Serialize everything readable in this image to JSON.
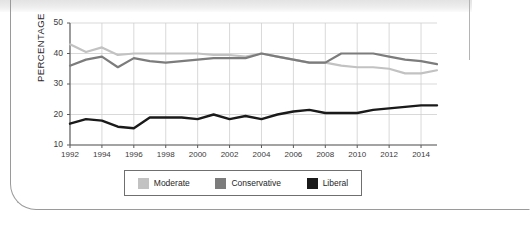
{
  "chart_data": {
    "type": "line",
    "title": "",
    "xlabel": "",
    "ylabel": "PERCENTAGE",
    "xlim": [
      1992,
      2015
    ],
    "ylim": [
      10,
      50
    ],
    "ytick_labels": [
      "50",
      "40",
      "30",
      "20",
      "10"
    ],
    "ytick_values": [
      50,
      40,
      30,
      20,
      10
    ],
    "xtick_labels": [
      "1992",
      "1994",
      "1996",
      "1998",
      "2000",
      "2002",
      "2004",
      "2006",
      "2008",
      "2010",
      "2012",
      "2014"
    ],
    "xtick_values": [
      1992,
      1994,
      1996,
      1998,
      2000,
      2002,
      2004,
      2006,
      2008,
      2010,
      2012,
      2014
    ],
    "grid": true,
    "legend_position": "bottom",
    "x": [
      1992,
      1993,
      1994,
      1995,
      1996,
      1997,
      1998,
      1999,
      2000,
      2001,
      2002,
      2003,
      2004,
      2005,
      2006,
      2007,
      2008,
      2009,
      2010,
      2011,
      2012,
      2013,
      2014,
      2015
    ],
    "series": [
      {
        "name": "Moderate",
        "color": "#c2c2c2",
        "values": [
          43.0,
          40.5,
          42.0,
          39.5,
          40.0,
          40.0,
          40.0,
          40.0,
          40.0,
          39.5,
          39.5,
          39.0,
          40.0,
          39.0,
          38.0,
          37.0,
          37.0,
          36.0,
          35.5,
          35.5,
          35.0,
          33.5,
          33.5,
          34.5
        ]
      },
      {
        "name": "Conservative",
        "color": "#7c7c7c",
        "values": [
          36.0,
          38.0,
          39.0,
          35.5,
          38.5,
          37.5,
          37.0,
          37.5,
          38.0,
          38.5,
          38.5,
          38.5,
          40.0,
          39.0,
          38.0,
          37.0,
          37.0,
          40.0,
          40.0,
          40.0,
          39.0,
          38.0,
          37.5,
          36.5
        ]
      },
      {
        "name": "Liberal",
        "color": "#1a1a1a",
        "values": [
          17.0,
          18.5,
          18.0,
          16.0,
          15.5,
          19.0,
          19.0,
          19.0,
          18.5,
          20.0,
          18.5,
          19.5,
          18.5,
          20.0,
          21.0,
          21.5,
          20.5,
          20.5,
          20.5,
          21.5,
          22.0,
          22.5,
          23.0,
          23.0
        ]
      }
    ]
  },
  "legend": {
    "items": [
      {
        "label": "Moderate",
        "color": "#c2c2c2"
      },
      {
        "label": "Conservative",
        "color": "#7c7c7c"
      },
      {
        "label": "Liberal",
        "color": "#1a1a1a"
      }
    ]
  }
}
